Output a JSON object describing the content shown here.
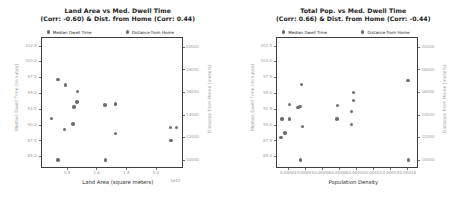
{
  "figure": {
    "width": 471,
    "height": 197,
    "background": "#ffffff",
    "marker_color": "#6e6e6e",
    "axis_color": "#3d3d3d",
    "tick_label_color": "#9a9a9a"
  },
  "chart_data": [
    {
      "type": "scatter",
      "panel": "left",
      "title": "Land Area vs Med. Dwell Time\n(Corr: -0.60) & Dist. from Home (Corr: 0.44)",
      "title_line1": "Land Area vs Med. Dwell Time",
      "title_line2": "(Corr: -0.60) & Dist. from Home (Corr: 0.44)",
      "xlabel": "Land Area (square meters)",
      "ylabel": "Median Dwell Time (minutes)",
      "y2label": "Distance from Home (meters)",
      "x_offset_text": "1e12",
      "xticks": [
        0.5,
        1.0,
        1.5,
        2.0
      ],
      "xtick_labels": [
        "0.5",
        "1.0",
        "1.5",
        "2.0"
      ],
      "xlim": [
        0.05,
        2.45
      ],
      "yticks": [
        85.0,
        87.5,
        90.0,
        92.5,
        95.0,
        97.5,
        100.0,
        102.5
      ],
      "ytick_labels": [
        "85.0",
        "87.5",
        "90.0",
        "92.5",
        "95.0",
        "97.5",
        "100.0",
        "102.5"
      ],
      "ylim": [
        83.2,
        103.9
      ],
      "y2ticks": [
        10000,
        12000,
        14000,
        16000,
        18000,
        20000
      ],
      "y2tick_labels": [
        "10000",
        "12000",
        "14000",
        "16000",
        "18000",
        "20000"
      ],
      "y2lim": [
        9300,
        20900
      ],
      "grid": false,
      "legend_position": "top",
      "legend": [
        "Median Dwell Time",
        "Distance from Home"
      ],
      "series": [
        {
          "name": "Median Dwell Time",
          "axis": "left",
          "points": [
            {
              "x": 0.33,
              "y": 97.3
            },
            {
              "x": 0.46,
              "y": 96.5
            },
            {
              "x": 0.66,
              "y": 95.4
            },
            {
              "x": 0.65,
              "y": 93.8
            },
            {
              "x": 0.6,
              "y": 93.0
            },
            {
              "x": 0.22,
              "y": 91.2
            },
            {
              "x": 0.58,
              "y": 90.3
            },
            {
              "x": 0.44,
              "y": 89.4
            },
            {
              "x": 0.33,
              "y": 84.6
            },
            {
              "x": 1.12,
              "y": 93.3
            },
            {
              "x": 1.3,
              "y": 93.5
            },
            {
              "x": 1.3,
              "y": 88.8
            },
            {
              "x": 1.13,
              "y": 84.6
            }
          ]
        },
        {
          "name": "Distance from Home",
          "axis": "right",
          "points": [
            {
              "x": 2.23,
              "y": 13000
            },
            {
              "x": 2.33,
              "y": 13000
            },
            {
              "x": 2.24,
              "y": 11800
            }
          ]
        }
      ]
    },
    {
      "type": "scatter",
      "panel": "right",
      "title": "Total Pop. vs Med. Dwell Time\n(Corr: 0.66) & Dist. from Home (Corr: -0.44)",
      "title_line1": "Total Pop. vs Med. Dwell Time",
      "title_line2": "(Corr: 0.66) & Dist. from Home (Corr: -0.44)",
      "xlabel": "Population Density",
      "ylabel": "Median Dwell Time (minutes)",
      "y2label": "Distance from Home (meters)",
      "x_offset_text": "",
      "xticks": [
        2e-05,
        4e-05,
        6e-05,
        8e-05,
        0.0001,
        0.00012,
        0.00014,
        0.00016
      ],
      "xtick_labels": [
        "0.00002",
        "0.00004",
        "0.00006",
        "0.00008",
        "0.00010",
        "0.00012",
        "0.00014",
        "0.00016"
      ],
      "xlim": [
        5.5e-06,
        0.000172
      ],
      "yticks": [
        85.0,
        87.5,
        90.0,
        92.5,
        95.0,
        97.5,
        100.0,
        102.5
      ],
      "ytick_labels": [
        "85.0",
        "87.5",
        "90.0",
        "92.5",
        "95.0",
        "97.5",
        "100.0",
        "102.5"
      ],
      "ylim": [
        83.2,
        103.9
      ],
      "y2ticks": [
        10000,
        12000,
        14000,
        16000,
        18000,
        20000
      ],
      "y2tick_labels": [
        "10000",
        "12000",
        "14000",
        "16000",
        "18000",
        "20000"
      ],
      "y2lim": [
        9300,
        20900
      ],
      "grid": false,
      "legend_position": "top",
      "legend": [
        "Median Dwell Time",
        "Distance from Home"
      ],
      "series": [
        {
          "name": "Median Dwell Time",
          "axis": "left",
          "points": [
            {
              "x": 3.45e-05,
              "y": 96.6
            },
            {
              "x": 2.05e-05,
              "y": 93.4
            },
            {
              "x": 3.25e-05,
              "y": 93.1
            },
            {
              "x": 3e-05,
              "y": 92.9
            },
            {
              "x": 1.15e-05,
              "y": 91.1
            },
            {
              "x": 2.05e-05,
              "y": 91.1
            },
            {
              "x": 3.55e-05,
              "y": 89.9
            },
            {
              "x": 1.5e-05,
              "y": 88.9
            },
            {
              "x": 1e-05,
              "y": 88.2
            },
            {
              "x": 3.3e-05,
              "y": 84.6
            },
            {
              "x": 7.65e-05,
              "y": 93.2
            },
            {
              "x": 7.6e-05,
              "y": 91.1
            },
            {
              "x": 9.5e-05,
              "y": 95.3
            },
            {
              "x": 9.55e-05,
              "y": 94.0
            },
            {
              "x": 9.3e-05,
              "y": 92.3
            },
            {
              "x": 9.25e-05,
              "y": 90.2
            },
            {
              "x": 0.000159,
              "y": 97.2
            },
            {
              "x": 0.0001595,
              "y": 84.6
            }
          ]
        },
        {
          "name": "Distance from Home",
          "axis": "right",
          "points": []
        }
      ]
    }
  ]
}
